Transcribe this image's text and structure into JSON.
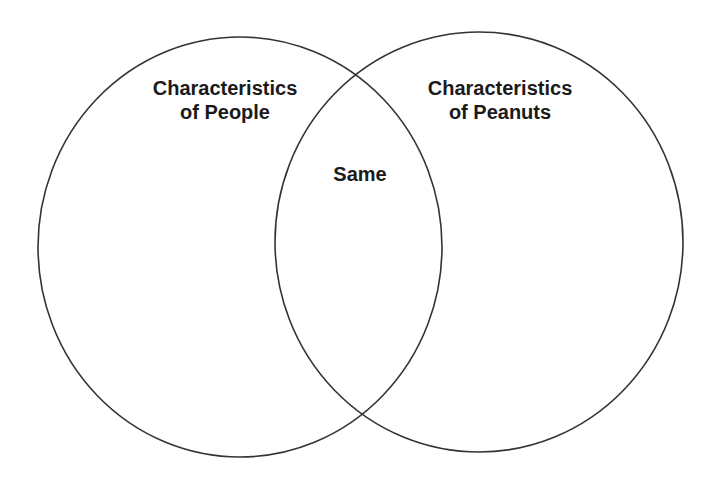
{
  "diagram": {
    "type": "venn",
    "sets": [
      {
        "id": "left",
        "label_lines": [
          "Characteristics",
          "of People"
        ],
        "shape": {
          "cx": 240,
          "cy": 247,
          "rx": 202,
          "ry": 210
        }
      },
      {
        "id": "right",
        "label_lines": [
          "Characteristics",
          "of Peanuts"
        ],
        "shape": {
          "cx": 479,
          "cy": 242,
          "rx": 204,
          "ry": 210
        }
      }
    ],
    "intersection": {
      "label": "Same"
    },
    "colors": {
      "stroke": "#333333",
      "background": "#ffffff",
      "text": "#1a1a1a"
    }
  }
}
